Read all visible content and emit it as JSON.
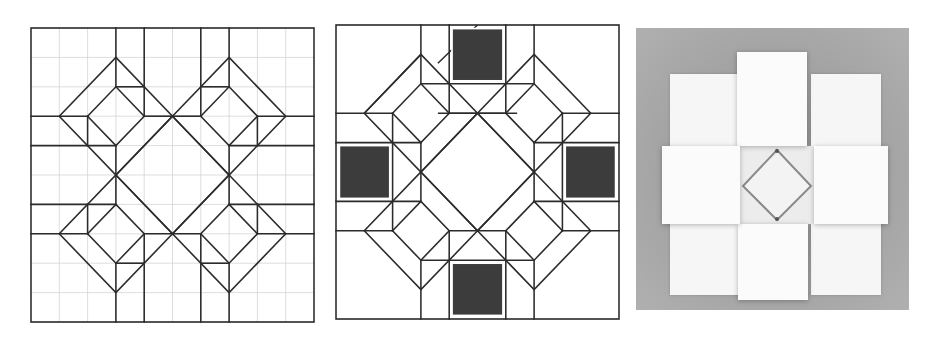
{
  "figure": {
    "panels": [
      {
        "id": "crease-pattern-grid",
        "description": "Crease pattern on a 10x10 reference grid",
        "grid_divisions": 10,
        "line_color": "#2b2b2b",
        "grid_color": "#cfcfcf"
      },
      {
        "id": "crease-pattern-shaded",
        "description": "Same crease pattern with four shaded squares marking the raised flaps",
        "shaded_squares": 4,
        "shade_color": "#3c3c3c"
      },
      {
        "id": "folded-photo",
        "description": "Photograph of the folded paper model: a cross of raised square flaps around a central diamond well",
        "background_color": "#a9a9a9",
        "paper_color": "#f6f6f6"
      }
    ]
  }
}
